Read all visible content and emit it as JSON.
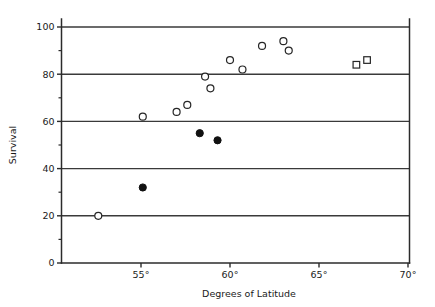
{
  "chart_data": {
    "type": "scatter",
    "title": "",
    "subtitle": "",
    "xlabel": "Degrees of Latitude",
    "ylabel": "Survival",
    "xlim": [
      51.0,
      70.0
    ],
    "ylim": [
      0,
      100
    ],
    "xticks": [
      55,
      60,
      65,
      70
    ],
    "xtick_labels": [
      "55°",
      "60°",
      "65°",
      "70°"
    ],
    "yticks": [
      0,
      20,
      40,
      60,
      80,
      100
    ],
    "ytick_labels": [
      "0",
      "20",
      "40",
      "60",
      "80",
      "100"
    ],
    "y_minor_ticks": [
      10,
      30,
      50,
      70,
      90
    ],
    "gridlines": {
      "horizontal_at": [
        20,
        40,
        60,
        80,
        100
      ],
      "vertical": false
    },
    "legend": {
      "visible": false,
      "position": "none",
      "entries": [
        {
          "name": "open-circle",
          "marker": "open circle"
        },
        {
          "name": "filled-circle",
          "marker": "filled circle"
        },
        {
          "name": "open-square",
          "marker": "open square"
        }
      ]
    },
    "series": [
      {
        "name": "open-circle",
        "marker": "open-circle",
        "points": [
          {
            "x": 52.6,
            "y": 20
          },
          {
            "x": 55.1,
            "y": 62
          },
          {
            "x": 57.0,
            "y": 64
          },
          {
            "x": 57.6,
            "y": 67
          },
          {
            "x": 58.6,
            "y": 79
          },
          {
            "x": 58.9,
            "y": 74
          },
          {
            "x": 60.0,
            "y": 86
          },
          {
            "x": 60.7,
            "y": 82
          },
          {
            "x": 61.8,
            "y": 92
          },
          {
            "x": 63.0,
            "y": 94
          },
          {
            "x": 63.3,
            "y": 90
          }
        ]
      },
      {
        "name": "filled-circle",
        "marker": "filled-circle",
        "points": [
          {
            "x": 55.1,
            "y": 32
          },
          {
            "x": 58.3,
            "y": 55
          },
          {
            "x": 59.3,
            "y": 52
          }
        ]
      },
      {
        "name": "open-square",
        "marker": "open-square",
        "points": [
          {
            "x": 67.1,
            "y": 84
          },
          {
            "x": 67.7,
            "y": 86
          }
        ]
      }
    ]
  },
  "axes": {
    "y_title": "Survival",
    "x_title": "Degrees of Latitude"
  },
  "colors": {
    "background": "#ffffff",
    "axis": "#2b2b2b",
    "grid": "#3a3a3a",
    "marker_open": "#ffffff",
    "marker_edge": "#262626",
    "marker_filled": "#111111"
  }
}
